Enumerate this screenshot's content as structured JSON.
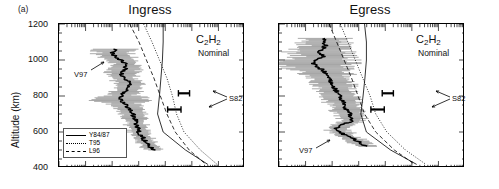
{
  "figure": {
    "panel_letter": "(a)",
    "y_axis_label": "Altitude (km)",
    "y_ticks": [
      1200,
      1000,
      800,
      600,
      400
    ],
    "y_min": 400,
    "y_max": 1200,
    "x_scale": "log",
    "x_decades": 7,
    "grid": false,
    "line_color": "#000000",
    "errorbar_color": "#7f7f7f"
  },
  "panels": [
    {
      "title": "Ingress",
      "species": "C",
      "species_sub1": "2",
      "species_mid": "H",
      "species_sub2": "2",
      "species_full": "C2H2",
      "condition": "Nominal",
      "data_label": "V97",
      "ref_label": "S82"
    },
    {
      "title": "Egress",
      "species": "C",
      "species_sub1": "2",
      "species_mid": "H",
      "species_sub2": "2",
      "species_full": "C2H2",
      "condition": "Nominal",
      "data_label": "V97",
      "ref_label": "S82"
    }
  ],
  "legend": {
    "items": [
      {
        "label": "Y84/87",
        "style": "solid"
      },
      {
        "label": "T95",
        "style": "dotted"
      },
      {
        "label": "L96",
        "style": "dashed"
      }
    ]
  },
  "chart_data": {
    "type": "line",
    "xlabel": "",
    "ylabel": "Altitude (km)",
    "ylim": [
      400,
      1200
    ],
    "xscale": "log",
    "xlim_decades": 7,
    "legend_position": "lower-left",
    "annotations": [
      "(a)",
      "V97",
      "S82",
      "C2H2",
      "Nominal"
    ],
    "panels": [
      {
        "name": "Ingress",
        "series": [
          {
            "name": "V97",
            "style": "solid-noisy",
            "comment": "retrieved profile with horizontal error bars",
            "altitude": [
              1060,
              1040,
              1020,
              1000,
              980,
              960,
              940,
              920,
              900,
              880,
              860,
              840,
              820,
              800,
              780,
              760,
              740,
              720,
              700,
              680,
              660,
              640,
              620,
              600,
              580,
              560,
              540,
              520,
              500
            ],
            "x_frac": [
              0.3,
              0.288,
              0.3,
              0.33,
              0.352,
              0.36,
              0.35,
              0.338,
              0.352,
              0.372,
              0.382,
              0.374,
              0.352,
              0.338,
              0.33,
              0.352,
              0.368,
              0.386,
              0.398,
              0.404,
              0.412,
              0.418,
              0.424,
              0.43,
              0.442,
              0.456,
              0.47,
              0.486,
              0.51
            ],
            "err_frac": [
              0.085,
              0.09,
              0.08,
              0.075,
              0.07,
              0.068,
              0.07,
              0.072,
              0.068,
              0.064,
              0.062,
              0.064,
              0.07,
              0.074,
              0.15,
              0.07,
              0.064,
              0.06,
              0.058,
              0.056,
              0.054,
              0.052,
              0.05,
              0.048,
              0.046,
              0.044,
              0.042,
              0.04,
              0.036
            ]
          },
          {
            "name": "Y84/87",
            "style": "solid",
            "altitude": [
              1200,
              1100,
              1000,
              900,
              800,
              700,
              600,
              500,
              420
            ],
            "x_frac": [
              0.56,
              0.56,
              0.556,
              0.548,
              0.54,
              0.53,
              0.56,
              0.68,
              0.8
            ]
          },
          {
            "name": "T95",
            "style": "dotted",
            "altitude": [
              1200,
              1100,
              1000,
              900,
              800,
              700,
              600,
              500,
              420
            ],
            "x_frac": [
              0.455,
              0.5,
              0.54,
              0.58,
              0.61,
              0.632,
              0.672,
              0.76,
              0.85
            ]
          },
          {
            "name": "L96",
            "style": "dashed",
            "altitude": [
              1200,
              1100,
              1000,
              900,
              800,
              700,
              600,
              500,
              420
            ],
            "x_frac": [
              0.38,
              0.43,
              0.47,
              0.51,
              0.545,
              0.58,
              0.625,
              0.7,
              0.79
            ]
          }
        ],
        "reference_points": [
          {
            "name": "S82",
            "altitude": 815,
            "x_frac": 0.672,
            "err_frac": 0.03
          },
          {
            "name": "S82",
            "altitude": 725,
            "x_frac": 0.62,
            "err_frac": 0.036
          }
        ]
      },
      {
        "name": "Egress",
        "series": [
          {
            "name": "V97",
            "style": "solid-noisy",
            "comment": "retrieved profile with horizontal error bars",
            "altitude": [
              1120,
              1100,
              1080,
              1060,
              1040,
              1020,
              1000,
              980,
              960,
              940,
              920,
              900,
              880,
              860,
              840,
              820,
              800,
              780,
              760,
              740,
              720,
              700,
              680,
              660,
              640,
              620,
              600,
              580,
              560,
              540,
              520
            ],
            "x_frac": [
              0.25,
              0.236,
              0.25,
              0.23,
              0.215,
              0.236,
              0.2,
              0.18,
              0.21,
              0.24,
              0.256,
              0.268,
              0.28,
              0.29,
              0.3,
              0.312,
              0.324,
              0.336,
              0.348,
              0.356,
              0.368,
              0.378,
              0.386,
              0.392,
              0.34,
              0.31,
              0.33,
              0.36,
              0.4,
              0.44,
              0.47
            ],
            "err_frac": [
              0.11,
              0.115,
              0.105,
              0.12,
              0.16,
              0.12,
              0.175,
              0.19,
              0.15,
              0.12,
              0.11,
              0.105,
              0.1,
              0.096,
              0.092,
              0.088,
              0.084,
              0.08,
              0.078,
              0.074,
              0.07,
              0.068,
              0.066,
              0.064,
              0.06,
              0.058,
              0.056,
              0.054,
              0.052,
              0.05,
              0.048
            ]
          },
          {
            "name": "Y84/87",
            "style": "solid",
            "altitude": [
              1200,
              1100,
              1000,
              900,
              800,
              700,
              600,
              500,
              420
            ],
            "x_frac": [
              0.46,
              0.47,
              0.47,
              0.462,
              0.452,
              0.44,
              0.47,
              0.6,
              0.74
            ]
          },
          {
            "name": "T95",
            "style": "dotted",
            "altitude": [
              1200,
              1100,
              1000,
              900,
              800,
              700,
              600,
              500,
              420
            ],
            "x_frac": [
              0.33,
              0.37,
              0.41,
              0.45,
              0.49,
              0.52,
              0.58,
              0.68,
              0.79
            ]
          },
          {
            "name": "L96",
            "style": "dashed",
            "altitude": [
              1200,
              1100,
              1000,
              900,
              800,
              700,
              600,
              500,
              420
            ],
            "x_frac": [
              0.27,
              0.31,
              0.35,
              0.39,
              0.425,
              0.46,
              0.52,
              0.62,
              0.73
            ]
          }
        ],
        "reference_points": [
          {
            "name": "S82",
            "altitude": 815,
            "x_frac": 0.585,
            "err_frac": 0.03
          },
          {
            "name": "S82",
            "altitude": 725,
            "x_frac": 0.53,
            "err_frac": 0.036
          }
        ]
      }
    ]
  }
}
